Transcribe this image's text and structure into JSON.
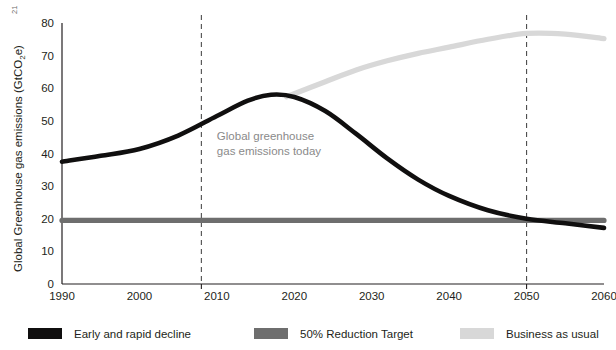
{
  "chart_data": {
    "type": "line",
    "title": "",
    "xlabel": "",
    "ylabel": "Global Greenhouse gas emissions (GtCO",
    "ylabel_sub": "2",
    "ylabel_tail": "e)",
    "ylabel_footnote": "21",
    "xlim": [
      1990,
      2060
    ],
    "ylim": [
      0,
      80
    ],
    "grid": false,
    "legend_position": "bottom",
    "xticks": [
      1990,
      2000,
      2010,
      2020,
      2030,
      2040,
      2050,
      2060
    ],
    "xtick_labels": [
      "1990",
      "2000",
      "2010",
      "2020",
      "2030",
      "2040",
      "2050",
      "2060"
    ],
    "yticks": [
      0,
      10,
      20,
      30,
      40,
      50,
      60,
      70,
      80
    ],
    "ytick_labels": [
      "0",
      "10",
      "20",
      "30",
      "40",
      "50",
      "60",
      "70",
      "80"
    ],
    "annotations": [
      {
        "id": "today-annotation",
        "lines": [
          "Global greenhouse",
          "gas emissions today"
        ],
        "x": 2010,
        "y": 44
      }
    ],
    "vertical_markers": [
      {
        "id": "marker-today",
        "x": 2008,
        "label": ""
      },
      {
        "id": "marker-2050",
        "x": 2050,
        "label": ""
      }
    ],
    "series": [
      {
        "name": "Early and rapid decline",
        "color": "#100f0f",
        "width": 4.6,
        "x": [
          1990,
          1995,
          2000,
          2005,
          2010,
          2014,
          2017,
          2020,
          2024,
          2028,
          2032,
          2036,
          2040,
          2045,
          2050,
          2055,
          2060
        ],
        "values": [
          37.5,
          39.3,
          41.4,
          45.5,
          51.5,
          56.2,
          58.0,
          57.3,
          53.0,
          46.0,
          38.5,
          32.0,
          27.0,
          22.6,
          20.0,
          18.6,
          17.2
        ]
      },
      {
        "name": "50% Reduction Target",
        "color": "#6e6e6e",
        "width": 5.2,
        "x": [
          1990,
          2060
        ],
        "values": [
          19.5,
          19.5
        ]
      },
      {
        "name": "Business as usual",
        "color": "#d8d8d8",
        "width": 5.2,
        "x": [
          2019,
          2024,
          2028,
          2032,
          2036,
          2040,
          2045,
          2050,
          2055,
          2060
        ],
        "values": [
          57.4,
          62.0,
          65.6,
          68.4,
          70.7,
          72.6,
          75.0,
          76.8,
          76.6,
          75.2
        ]
      }
    ],
    "legend": [
      {
        "label": "Early and rapid decline",
        "color": "#100f0f"
      },
      {
        "label": "50% Reduction Target",
        "color": "#6e6e6e"
      },
      {
        "label": "Business as usual",
        "color": "#d8d8d8"
      }
    ]
  }
}
